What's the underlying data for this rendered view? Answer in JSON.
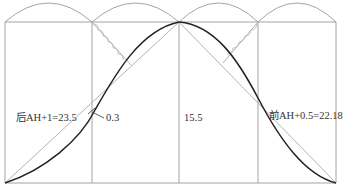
{
  "diagram": {
    "type": "roof-slope-construction",
    "colors": {
      "grid": "#9a9a9a",
      "curve": "#222222",
      "chord": "#aaaaaa",
      "text": "#333333",
      "background": "#ffffff"
    },
    "labels": {
      "left_slope": "后AH+1=23.5",
      "offset": "0.3",
      "middle": "15.5",
      "right_slope": "前AH+0.5=22.18"
    }
  }
}
